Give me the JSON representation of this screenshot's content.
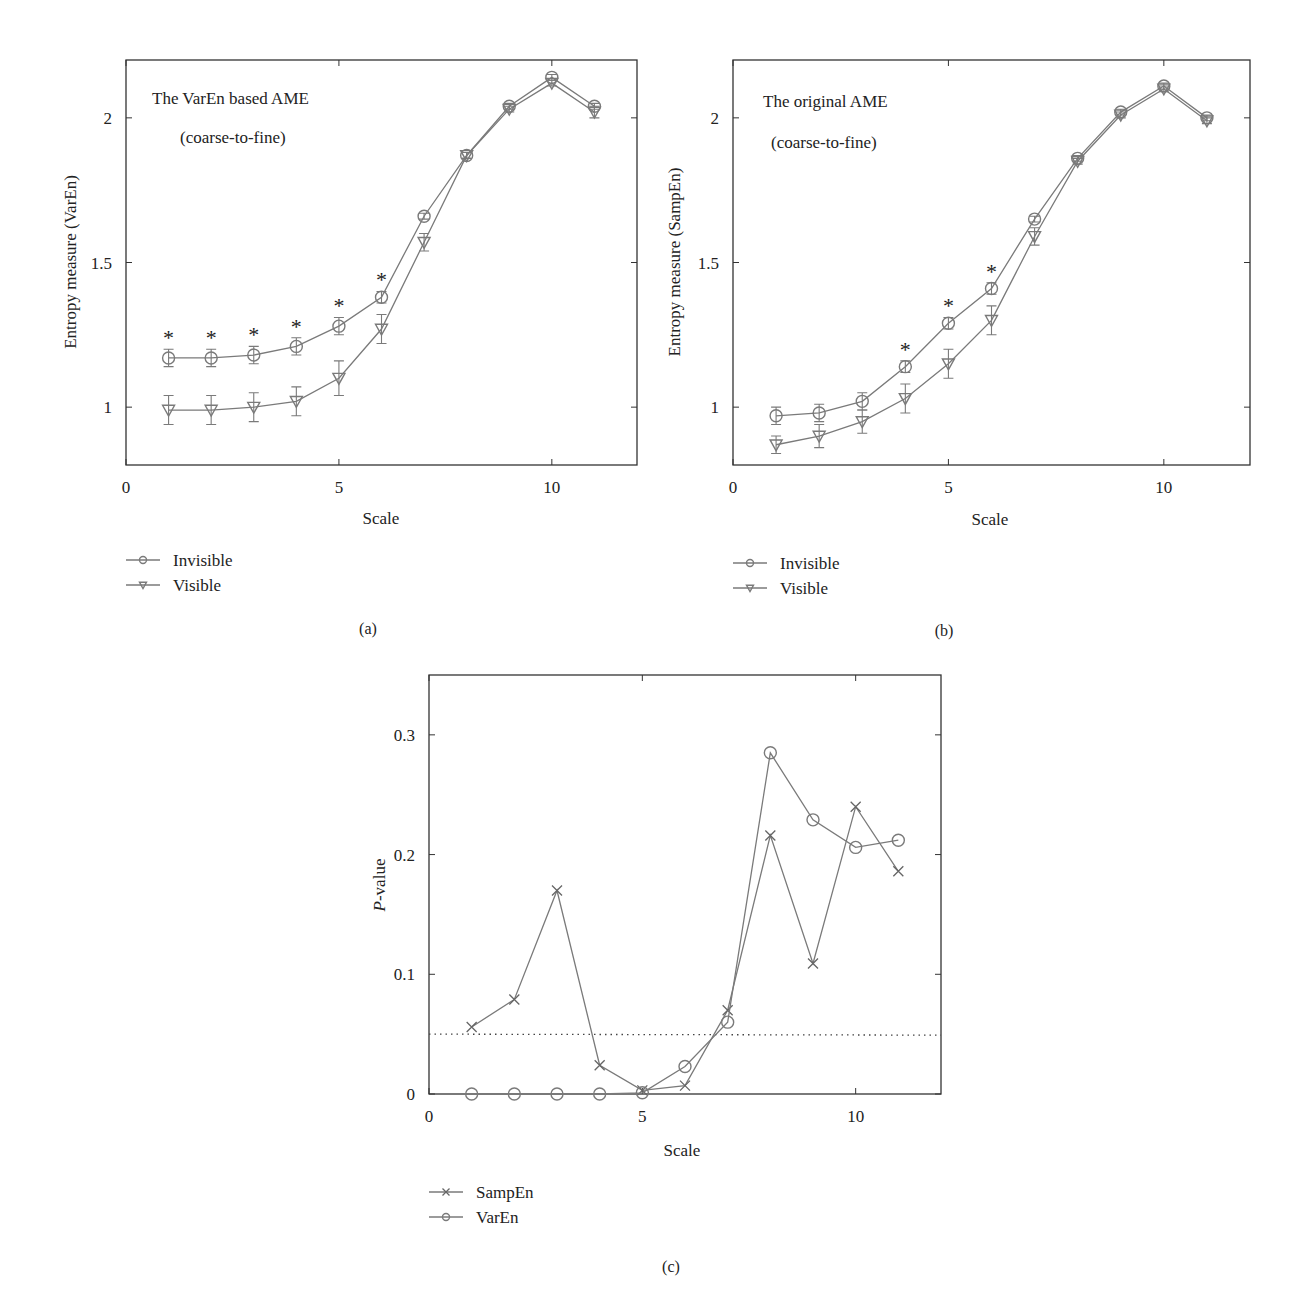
{
  "chart_data": [
    {
      "panel": "(a)",
      "type": "line",
      "title": "",
      "annotation": [
        "The VarEn based AME",
        "(coarse-to-fine)"
      ],
      "xlabel": "Scale",
      "ylabel": "Entropy measure (VarEn)",
      "xlim": [
        0,
        12
      ],
      "ylim": [
        0.8,
        2.2
      ],
      "xticks": [
        0,
        5,
        10
      ],
      "yticks": [
        1,
        1.5,
        2
      ],
      "x": [
        1,
        2,
        3,
        4,
        5,
        6,
        7,
        8,
        9,
        10,
        11
      ],
      "series": [
        {
          "name": "Invisible",
          "marker": "circle",
          "values": [
            1.17,
            1.17,
            1.18,
            1.21,
            1.28,
            1.38,
            1.66,
            1.87,
            2.04,
            2.14,
            2.04
          ],
          "errors": [
            0.03,
            0.03,
            0.03,
            0.03,
            0.03,
            0.02,
            0.01,
            0.01,
            0.01,
            0.01,
            0.01
          ]
        },
        {
          "name": "Visible",
          "marker": "triangle-down",
          "values": [
            0.99,
            0.99,
            1.0,
            1.02,
            1.1,
            1.27,
            1.57,
            1.87,
            2.03,
            2.12,
            2.02
          ],
          "errors": [
            0.05,
            0.05,
            0.05,
            0.05,
            0.06,
            0.05,
            0.03,
            0.01,
            0.01,
            0.01,
            0.02
          ]
        }
      ],
      "significance_markers": [
        1,
        2,
        3,
        4,
        5,
        6
      ],
      "grid": false,
      "legend_position": "below-left"
    },
    {
      "panel": "(b)",
      "type": "line",
      "title": "",
      "annotation": [
        "The original AME",
        "(coarse-to-fine)"
      ],
      "xlabel": "Scale",
      "ylabel": "Entropy measure (SampEn)",
      "xlim": [
        0,
        12
      ],
      "ylim": [
        0.8,
        2.2
      ],
      "xticks": [
        0,
        5,
        10
      ],
      "yticks": [
        1,
        1.5,
        2
      ],
      "x": [
        1,
        2,
        3,
        4,
        5,
        6,
        7,
        8,
        9,
        10,
        11
      ],
      "series": [
        {
          "name": "Invisible",
          "marker": "circle",
          "values": [
            0.97,
            0.98,
            1.02,
            1.14,
            1.29,
            1.41,
            1.65,
            1.86,
            2.02,
            2.11,
            2.0
          ],
          "errors": [
            0.03,
            0.03,
            0.03,
            0.02,
            0.02,
            0.02,
            0.01,
            0.01,
            0.01,
            0.01,
            0.01
          ]
        },
        {
          "name": "Visible",
          "marker": "triangle-down",
          "values": [
            0.87,
            0.9,
            0.95,
            1.03,
            1.15,
            1.3,
            1.59,
            1.85,
            2.01,
            2.1,
            1.99
          ],
          "errors": [
            0.03,
            0.04,
            0.04,
            0.05,
            0.05,
            0.05,
            0.03,
            0.01,
            0.01,
            0.01,
            0.01
          ]
        }
      ],
      "significance_markers": [
        4,
        5,
        6
      ],
      "grid": false,
      "legend_position": "below-left"
    },
    {
      "panel": "(c)",
      "type": "line",
      "title": "",
      "xlabel": "Scale",
      "ylabel": "P-value",
      "xlim": [
        0,
        12
      ],
      "ylim": [
        0,
        0.35
      ],
      "xticks": [
        0,
        5,
        10
      ],
      "yticks": [
        0,
        0.1,
        0.2,
        0.3
      ],
      "x": [
        1,
        2,
        3,
        4,
        5,
        6,
        7,
        8,
        9,
        10,
        11
      ],
      "series": [
        {
          "name": "SampEn",
          "marker": "x",
          "values": [
            0.056,
            0.079,
            0.17,
            0.024,
            0.003,
            0.007,
            0.07,
            0.216,
            0.109,
            0.24,
            0.186
          ]
        },
        {
          "name": "VarEn",
          "marker": "circle",
          "values": [
            0.0,
            0.0,
            0.0,
            0.0,
            0.001,
            0.023,
            0.06,
            0.285,
            0.229,
            0.206,
            0.212
          ]
        }
      ],
      "reference_line": {
        "y": 0.05,
        "style": "dotted"
      },
      "grid": false,
      "legend_position": "below-left"
    }
  ],
  "panels": {
    "a": {
      "label": "(a)",
      "annotation_line1": "The VarEn based AME",
      "annotation_line2": "(coarse-to-fine)",
      "xlabel": "Scale",
      "ylabel": "Entropy measure (VarEn)",
      "legend": [
        "Invisible",
        "Visible"
      ]
    },
    "b": {
      "label": "(b)",
      "annotation_line1": "The original AME",
      "annotation_line2": "(coarse-to-fine)",
      "xlabel": "Scale",
      "ylabel": "Entropy measure (SampEn)",
      "legend": [
        "Invisible",
        "Visible"
      ]
    },
    "c": {
      "label": "(c)",
      "xlabel": "Scale",
      "ylabel_italic": "P",
      "ylabel_rest": "-value",
      "legend": [
        "SampEn",
        "VarEn"
      ]
    }
  },
  "colors": {
    "axis": "#333333",
    "series_line": "#7a7a7a",
    "text": "#222222"
  }
}
